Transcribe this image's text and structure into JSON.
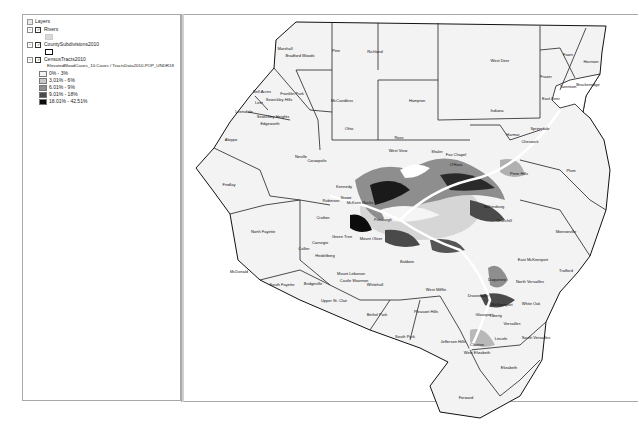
{
  "toc": {
    "root_label": "Layers",
    "layers": [
      {
        "name": "Rivers",
        "checked": true,
        "expanded": true,
        "symbol_color": "#d8d8d8"
      },
      {
        "name": "CountySubdivisions2010",
        "checked": true,
        "expanded": true,
        "symbol_color": "#ffffff"
      },
      {
        "name": "CensusTracts2010",
        "checked": true,
        "expanded": true,
        "field": "ElevatedBloodCases_10.Cases / TractsData2010.POP_UNDR18",
        "classes": [
          {
            "label": "0% - 3%",
            "color": "#f2f2f2"
          },
          {
            "label": "3.01% - 6%",
            "color": "#c8c8c8"
          },
          {
            "label": "6.01% - 9%",
            "color": "#8e8e8e"
          },
          {
            "label": "9.01% - 18%",
            "color": "#4a4a4a"
          },
          {
            "label": "18.01% - 42.51%",
            "color": "#0c0c0c"
          }
        ]
      }
    ]
  },
  "map": {
    "labels": [
      {
        "t": "Marshall",
        "x": 285,
        "y": 50
      },
      {
        "t": "Bradford Woods",
        "x": 300,
        "y": 57
      },
      {
        "t": "Pine",
        "x": 336,
        "y": 52
      },
      {
        "t": "Richland",
        "x": 375,
        "y": 53
      },
      {
        "t": "West Deer",
        "x": 500,
        "y": 62
      },
      {
        "t": "Fawn",
        "x": 568,
        "y": 56
      },
      {
        "t": "Harrison",
        "x": 591,
        "y": 63
      },
      {
        "t": "Frazer",
        "x": 546,
        "y": 78
      },
      {
        "t": "Brackenridge",
        "x": 588,
        "y": 86
      },
      {
        "t": "Tarentum",
        "x": 568,
        "y": 88
      },
      {
        "t": "East Deer",
        "x": 551,
        "y": 100
      },
      {
        "t": "Bell Acres",
        "x": 262,
        "y": 93
      },
      {
        "t": "Franklin Park",
        "x": 292,
        "y": 95
      },
      {
        "t": "Sewickley Hills",
        "x": 279,
        "y": 101
      },
      {
        "t": "Leet",
        "x": 259,
        "y": 104
      },
      {
        "t": "McCandless",
        "x": 342,
        "y": 102
      },
      {
        "t": "Hampton",
        "x": 417,
        "y": 102
      },
      {
        "t": "Leetsdale",
        "x": 244,
        "y": 113
      },
      {
        "t": "Sewickley Heights",
        "x": 273,
        "y": 118
      },
      {
        "t": "Indiana",
        "x": 497,
        "y": 112
      },
      {
        "t": "Edgeworth",
        "x": 270,
        "y": 125
      },
      {
        "t": "Ohio",
        "x": 349,
        "y": 130
      },
      {
        "t": "Harmar",
        "x": 513,
        "y": 136
      },
      {
        "t": "Springdale",
        "x": 540,
        "y": 130
      },
      {
        "t": "Cheswick",
        "x": 530,
        "y": 143
      },
      {
        "t": "Aleppo",
        "x": 231,
        "y": 141
      },
      {
        "t": "Ross",
        "x": 399,
        "y": 139
      },
      {
        "t": "West View",
        "x": 398,
        "y": 152
      },
      {
        "t": "Shaler",
        "x": 437,
        "y": 153
      },
      {
        "t": "Fox Chapel",
        "x": 456,
        "y": 156
      },
      {
        "t": "O'Hara",
        "x": 456,
        "y": 166
      },
      {
        "t": "Neville",
        "x": 301,
        "y": 158
      },
      {
        "t": "Coraopolis",
        "x": 317,
        "y": 162
      },
      {
        "t": "Findlay",
        "x": 229,
        "y": 186
      },
      {
        "t": "Plum",
        "x": 571,
        "y": 172
      },
      {
        "t": "Penn Hills",
        "x": 519,
        "y": 175
      },
      {
        "t": "Kennedy",
        "x": 344,
        "y": 188
      },
      {
        "t": "Stowe",
        "x": 346,
        "y": 199
      },
      {
        "t": "McKees Rocks",
        "x": 360,
        "y": 204
      },
      {
        "t": "Robinson",
        "x": 331,
        "y": 202
      },
      {
        "t": "Pittsburgh",
        "x": 383,
        "y": 221
      },
      {
        "t": "Wilkinsburg",
        "x": 494,
        "y": 208
      },
      {
        "t": "Churchill",
        "x": 504,
        "y": 222
      },
      {
        "t": "North Fayette",
        "x": 263,
        "y": 233
      },
      {
        "t": "Monroeville",
        "x": 566,
        "y": 233
      },
      {
        "t": "Crafton",
        "x": 323,
        "y": 219
      },
      {
        "t": "Mount Oliver",
        "x": 371,
        "y": 240
      },
      {
        "t": "Collier",
        "x": 304,
        "y": 250
      },
      {
        "t": "Heidelberg",
        "x": 325,
        "y": 257
      },
      {
        "t": "Carnegie",
        "x": 320,
        "y": 244
      },
      {
        "t": "Green Tree",
        "x": 342,
        "y": 238
      },
      {
        "t": "Baldwin",
        "x": 407,
        "y": 263
      },
      {
        "t": "Mount Lebanon",
        "x": 351,
        "y": 275
      },
      {
        "t": "Castle Shannon",
        "x": 354,
        "y": 282
      },
      {
        "t": "Whitehall",
        "x": 375,
        "y": 286
      },
      {
        "t": "East McKeesport",
        "x": 533,
        "y": 261
      },
      {
        "t": "Trafford",
        "x": 566,
        "y": 272
      },
      {
        "t": "Duquesne",
        "x": 497,
        "y": 281
      },
      {
        "t": "North Versailles",
        "x": 530,
        "y": 283
      },
      {
        "t": "McDonald",
        "x": 239,
        "y": 273
      },
      {
        "t": "South Fayette",
        "x": 282,
        "y": 286
      },
      {
        "t": "Bridgeville",
        "x": 313,
        "y": 285
      },
      {
        "t": "West Mifflin",
        "x": 436,
        "y": 291
      },
      {
        "t": "Upper St. Clair",
        "x": 334,
        "y": 302
      },
      {
        "t": "Bethel Park",
        "x": 377,
        "y": 316
      },
      {
        "t": "McKeesport",
        "x": 502,
        "y": 306
      },
      {
        "t": "White Oak",
        "x": 531,
        "y": 305
      },
      {
        "t": "Pleasant Hills",
        "x": 426,
        "y": 313
      },
      {
        "t": "Dravosburg",
        "x": 478,
        "y": 297
      },
      {
        "t": "Glassport",
        "x": 484,
        "y": 316
      },
      {
        "t": "Liberty",
        "x": 496,
        "y": 317
      },
      {
        "t": "Versailles",
        "x": 512,
        "y": 325
      },
      {
        "t": "South Park",
        "x": 405,
        "y": 338
      },
      {
        "t": "Jefferson Hills",
        "x": 453,
        "y": 343
      },
      {
        "t": "Clairton",
        "x": 477,
        "y": 346
      },
      {
        "t": "Lincoln",
        "x": 501,
        "y": 340
      },
      {
        "t": "South Versailles",
        "x": 536,
        "y": 339
      },
      {
        "t": "West Elizabeth",
        "x": 477,
        "y": 354
      },
      {
        "t": "Elizabeth",
        "x": 509,
        "y": 369
      },
      {
        "t": "Forward",
        "x": 466,
        "y": 399
      }
    ]
  }
}
